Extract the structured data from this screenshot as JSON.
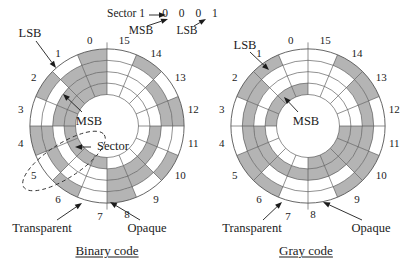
{
  "colors": {
    "shade": "#b4b4b4",
    "line": "#555555",
    "ink": "#1b1b1b",
    "background": "#ffffff"
  },
  "annotation": {
    "sector_label": "Sector 1",
    "bits": "0 0 0 1",
    "msb_label": "MSB",
    "lsb_label": "LSB"
  },
  "disks": [
    {
      "id": "binary",
      "caption": "Binary code",
      "lsb_label": "LSB",
      "msb_label": "MSB",
      "sector_label": "Sector",
      "transparent_label": "Transparent",
      "opaque_label": "Opaque",
      "sector_numbers": [
        "0",
        "1",
        "2",
        "3",
        "4",
        "5",
        "6",
        "7",
        "8",
        "9",
        "10",
        "11",
        "12",
        "13",
        "14",
        "15"
      ],
      "shaded_sectors_by_ring_outer_to_inner": [
        [
          0,
          2,
          4,
          6,
          8,
          10,
          12,
          14
        ],
        [
          0,
          1,
          4,
          5,
          8,
          9,
          12,
          13
        ],
        [
          0,
          1,
          2,
          3,
          8,
          9,
          10,
          11
        ],
        [
          0,
          1,
          2,
          3,
          4,
          5,
          6,
          7
        ]
      ]
    },
    {
      "id": "gray",
      "caption": "Gray code",
      "lsb_label": "LSB",
      "msb_label": "MSB",
      "transparent_label": "Transparent",
      "opaque_label": "Opaque",
      "sector_numbers": [
        "0",
        "1",
        "2",
        "3",
        "4",
        "5",
        "6",
        "7",
        "8",
        "9",
        "10",
        "11",
        "12",
        "13",
        "14",
        "15"
      ],
      "shaded_sectors_by_ring_outer_to_inner": [
        [
          1,
          2,
          5,
          6,
          9,
          10,
          13,
          14
        ],
        [
          2,
          3,
          4,
          5,
          10,
          11,
          12,
          13
        ],
        [
          4,
          5,
          6,
          7,
          8,
          9,
          10,
          11
        ],
        [
          0,
          1,
          2,
          3,
          8,
          9,
          10,
          11
        ]
      ]
    }
  ]
}
